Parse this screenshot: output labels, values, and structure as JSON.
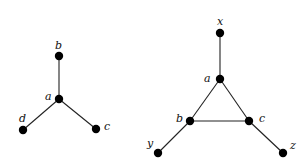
{
  "graphs": [
    {
      "id": "star",
      "nodes": [
        {
          "id": "b",
          "label": "b",
          "x": 59,
          "y": 56,
          "lx": 55,
          "ly": 41
        },
        {
          "id": "a",
          "label": "a",
          "x": 59,
          "y": 99,
          "lx": 45,
          "ly": 92
        },
        {
          "id": "d",
          "label": "d",
          "x": 23,
          "y": 130,
          "lx": 19,
          "ly": 114
        },
        {
          "id": "c",
          "label": "c",
          "x": 96,
          "y": 129,
          "lx": 104,
          "ly": 122
        }
      ],
      "edges": [
        [
          "a",
          "b"
        ],
        [
          "a",
          "d"
        ],
        [
          "a",
          "c"
        ]
      ]
    },
    {
      "id": "triangle-with-pendants",
      "nodes": [
        {
          "id": "x",
          "label": "x",
          "x": 220,
          "y": 33,
          "lx": 217,
          "ly": 17
        },
        {
          "id": "a",
          "label": "a",
          "x": 220,
          "y": 79,
          "lx": 204,
          "ly": 74
        },
        {
          "id": "b",
          "label": "b",
          "x": 190,
          "y": 121,
          "lx": 176,
          "ly": 114
        },
        {
          "id": "c",
          "label": "c",
          "x": 249,
          "y": 121,
          "lx": 259,
          "ly": 114
        },
        {
          "id": "y",
          "label": "y",
          "x": 158,
          "y": 153,
          "lx": 147,
          "ly": 139
        },
        {
          "id": "z",
          "label": "z",
          "x": 283,
          "y": 153,
          "lx": 290,
          "ly": 141
        }
      ],
      "edges": [
        [
          "x",
          "a"
        ],
        [
          "a",
          "b"
        ],
        [
          "a",
          "c"
        ],
        [
          "b",
          "c"
        ],
        [
          "b",
          "y"
        ],
        [
          "c",
          "z"
        ]
      ]
    }
  ]
}
